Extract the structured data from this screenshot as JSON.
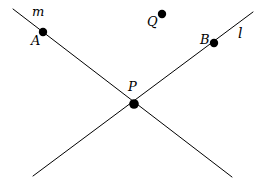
{
  "figure": {
    "type": "geometry-diagram",
    "background_color": "#ffffff",
    "stroke_color": "#000000",
    "point_color": "#000000",
    "stroke_width": 1,
    "point_radius": 4.2,
    "canvas": {
      "width": 265,
      "height": 189
    },
    "lines": [
      {
        "name": "m",
        "label": "m",
        "label_x": 32,
        "label_y": 5,
        "x1": 13,
        "y1": 9,
        "x2": 232,
        "y2": 177
      },
      {
        "name": "l",
        "label": "l",
        "label_x": 238,
        "label_y": 26,
        "x1": 33,
        "y1": 176,
        "x2": 253,
        "y2": 12
      }
    ],
    "points": [
      {
        "name": "A",
        "label": "A",
        "cx": 43,
        "cy": 32,
        "on_line": "m",
        "label_x": 31,
        "label_y": 34
      },
      {
        "name": "B",
        "label": "B",
        "cx": 214,
        "cy": 43,
        "on_line": "l",
        "label_x": 200,
        "label_y": 33
      },
      {
        "name": "P",
        "label": "P",
        "cx": 134,
        "cy": 104,
        "on_line": "l,m",
        "label_x": 128,
        "label_y": 80
      },
      {
        "name": "Q",
        "label": "Q",
        "cx": 162,
        "cy": 14,
        "on_line": "",
        "label_x": 147,
        "label_y": 15
      }
    ]
  }
}
